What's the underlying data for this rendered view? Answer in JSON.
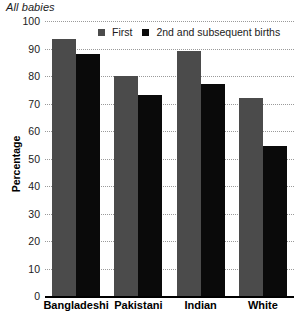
{
  "chart_data": {
    "type": "bar",
    "title": "All babies",
    "xlabel": "",
    "ylabel": "Percentage",
    "ylim": [
      0,
      100
    ],
    "yticks": [
      0,
      10,
      20,
      30,
      40,
      50,
      60,
      70,
      80,
      90,
      100
    ],
    "grid": true,
    "legend_position": "top-center",
    "categories": [
      "Bangladeshi",
      "Pakistani",
      "Indian",
      "White"
    ],
    "series": [
      {
        "name": "First",
        "color": "#4b4b4b",
        "values": [
          93.5,
          80,
          89,
          72
        ]
      },
      {
        "name": "2nd and subsequent births",
        "color": "#0a0a0a",
        "values": [
          88,
          73,
          77,
          54.5
        ]
      }
    ]
  }
}
